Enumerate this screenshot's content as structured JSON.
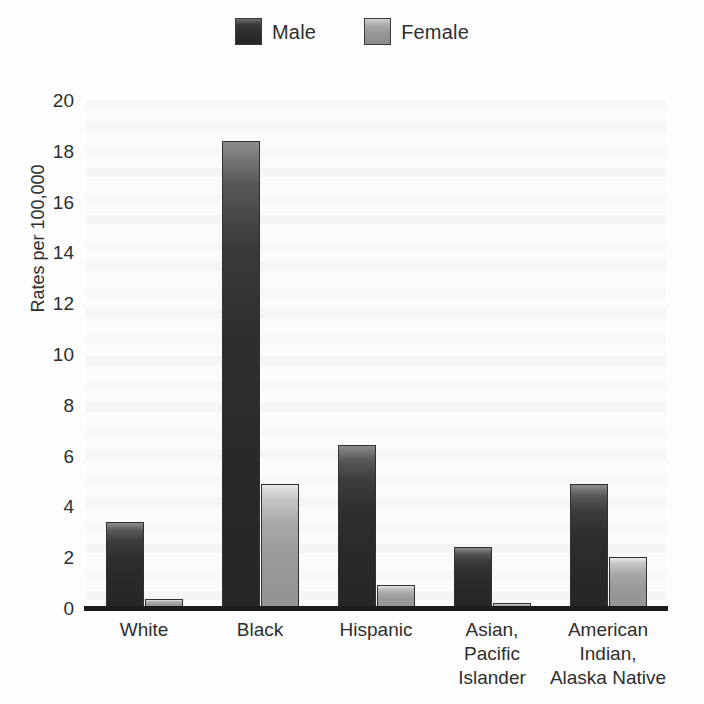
{
  "chart_data": {
    "type": "bar",
    "title": "",
    "subtitle": "",
    "xlabel": "",
    "ylabel": "Rates per 100,000",
    "ylim": [
      0,
      20
    ],
    "yticks": [
      20,
      18,
      16,
      14,
      12,
      10,
      8,
      6,
      4,
      2,
      0
    ],
    "ytick_labels": [
      "20",
      "18",
      "16",
      "14",
      "12",
      "10",
      "8",
      "6",
      "4",
      "2",
      "0"
    ],
    "grid": false,
    "legend_position": "top-center",
    "categories": [
      "White",
      "Black",
      "Hispanic",
      "Asian,\nPacific\nIslander",
      "American\nIndian,\nAlaska Native"
    ],
    "series": [
      {
        "name": "Male",
        "color": "#2e2e2e",
        "values": [
          3.4,
          18.4,
          6.4,
          2.4,
          4.9
        ]
      },
      {
        "name": "Female",
        "color": "#9a9a9a",
        "values": [
          0.35,
          4.9,
          0.9,
          0.2,
          2.0
        ]
      }
    ]
  },
  "legend": {
    "items": [
      {
        "label": "Male",
        "swatch": "male-swatch"
      },
      {
        "label": "Female",
        "swatch": "female-swatch"
      }
    ]
  },
  "axes": {
    "y_title": "Rates per 100,000"
  }
}
